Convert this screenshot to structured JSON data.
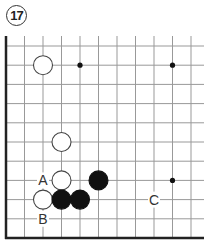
{
  "problem": {
    "number": "17"
  },
  "board": {
    "origin": {
      "x": 6,
      "y": 46
    },
    "spacing": {
      "x": 18.5,
      "y": 19.2
    },
    "cols": 11,
    "rows": 11,
    "top_y": 36,
    "right_x": 204,
    "edges": [
      "left",
      "bottom"
    ],
    "line_color": "#999999",
    "edge_color": "#222222",
    "stone_radius": 9.5
  },
  "star_points": [
    {
      "col": 4,
      "row": 1
    },
    {
      "col": 9,
      "row": 1
    },
    {
      "col": 9,
      "row": 7
    }
  ],
  "stones": [
    {
      "color": "white",
      "col": 2,
      "row": 1
    },
    {
      "color": "white",
      "col": 3,
      "row": 5
    },
    {
      "color": "white",
      "col": 3,
      "row": 7
    },
    {
      "color": "black",
      "col": 5,
      "row": 7
    },
    {
      "color": "white",
      "col": 2,
      "row": 8
    },
    {
      "color": "black",
      "col": 3,
      "row": 8
    },
    {
      "color": "black",
      "col": 4,
      "row": 8
    }
  ],
  "labels": [
    {
      "text": "A",
      "col": 2,
      "row": 7
    },
    {
      "text": "B",
      "col": 2,
      "row": 9
    },
    {
      "text": "C",
      "col": 8,
      "row": 8
    }
  ]
}
